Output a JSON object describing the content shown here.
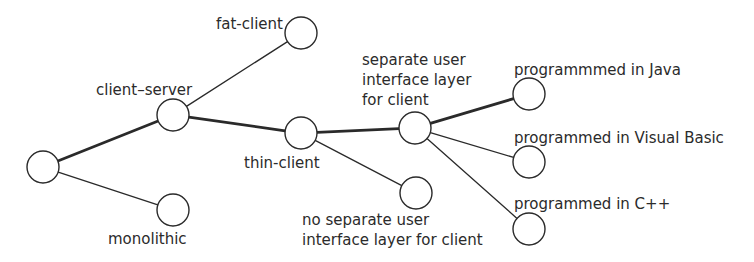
{
  "diagram": {
    "type": "decision-tree",
    "node_radius": 16,
    "colors": {
      "line": "#2a2a2a",
      "text": "#2b2b2b",
      "background": "#ffffff"
    },
    "nodes": [
      {
        "id": "root",
        "x": 43,
        "y": 167,
        "label_lines": []
      },
      {
        "id": "client-server",
        "x": 173,
        "y": 115,
        "label_lines": [
          "client–server"
        ],
        "label_x": 96,
        "label_y": 95
      },
      {
        "id": "monolithic",
        "x": 173,
        "y": 210,
        "label_lines": [
          "monolithic"
        ],
        "label_x": 108,
        "label_y": 244
      },
      {
        "id": "fat-client",
        "x": 301,
        "y": 33,
        "label_lines": [
          "fat-client"
        ],
        "label_x": 216,
        "label_y": 29
      },
      {
        "id": "thin-client",
        "x": 301,
        "y": 133,
        "label_lines": [
          "thin-client"
        ],
        "label_x": 244,
        "label_y": 168
      },
      {
        "id": "separate-ui",
        "x": 415,
        "y": 128,
        "label_lines": [
          "separate user",
          "interface layer",
          "for client"
        ],
        "label_x": 362,
        "label_y": 65
      },
      {
        "id": "no-separate-ui",
        "x": 416,
        "y": 193,
        "label_lines": [
          "no separate user",
          "interface layer for client"
        ],
        "label_x": 302,
        "label_y": 225
      },
      {
        "id": "java",
        "x": 529,
        "y": 94,
        "label_lines": [
          "programmmed in Java"
        ],
        "label_x": 514,
        "label_y": 75
      },
      {
        "id": "visual-basic",
        "x": 529,
        "y": 162,
        "label_lines": [
          "programmed in Visual Basic"
        ],
        "label_x": 514,
        "label_y": 143
      },
      {
        "id": "cpp",
        "x": 529,
        "y": 229,
        "label_lines": [
          "programmed in C++"
        ],
        "label_x": 514,
        "label_y": 209
      }
    ],
    "edges": [
      {
        "from": "root",
        "to": "client-server",
        "weight": "bold"
      },
      {
        "from": "root",
        "to": "monolithic",
        "weight": "thin"
      },
      {
        "from": "client-server",
        "to": "fat-client",
        "weight": "thin"
      },
      {
        "from": "client-server",
        "to": "thin-client",
        "weight": "bold"
      },
      {
        "from": "thin-client",
        "to": "separate-ui",
        "weight": "bold"
      },
      {
        "from": "thin-client",
        "to": "no-separate-ui",
        "weight": "thin"
      },
      {
        "from": "separate-ui",
        "to": "java",
        "weight": "bold"
      },
      {
        "from": "separate-ui",
        "to": "visual-basic",
        "weight": "thin"
      },
      {
        "from": "separate-ui",
        "to": "cpp",
        "weight": "thin"
      }
    ]
  }
}
